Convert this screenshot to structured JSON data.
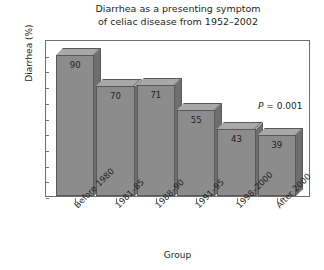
{
  "chart_data": {
    "type": "bar",
    "title": "Diarrhea as a presenting symptom\nof celiac disease from 1952–2002",
    "xlabel": "Group",
    "ylabel": "Diarrhea (%)",
    "categories": [
      "Before 1980",
      "1981–85",
      "1988–90",
      "1991–95",
      "1998–2000",
      "After 2000"
    ],
    "values": [
      90,
      70,
      71,
      55,
      43,
      39
    ],
    "ylim": [
      0,
      100
    ],
    "yticks": [
      0,
      10,
      20,
      30,
      40,
      50,
      60,
      70,
      80,
      90,
      100
    ],
    "grid": false,
    "legend": false,
    "annotations": [
      {
        "symbol": "P",
        "text": " = 0.001"
      }
    ],
    "style": {
      "bar_face_color": "#8c8c8c",
      "bar_top_color": "#a8a8a8",
      "bar_side_color": "#6e6e6e",
      "bar_edge_color": "#59595b",
      "frame_color": "#6e6e6e",
      "text_color": "#231f20",
      "background": "#ffffff"
    }
  }
}
